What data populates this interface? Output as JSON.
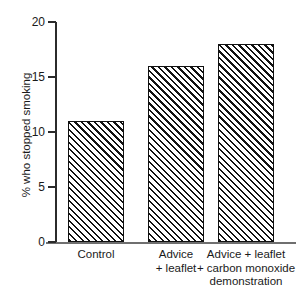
{
  "figure": {
    "top_clipped_text": "........ ..... .... ...... ... ......",
    "background_color": "#ffffff",
    "bar_outline_color": "#111111",
    "axis_color": "#2b2b2b"
  },
  "chart_data": {
    "type": "bar",
    "title": "",
    "xlabel": "",
    "ylabel": "% who stopped smoking",
    "categories": [
      "Control",
      "Advice\n+ leaflet",
      "Advice + leaflet\n+ carbon monoxide\ndemonstration"
    ],
    "category_lines": [
      [
        "Control"
      ],
      [
        "Advice",
        "+ leaflet"
      ],
      [
        "Advice + leaflet",
        "+ carbon monoxide",
        "demonstration"
      ]
    ],
    "values": [
      11,
      16,
      18
    ],
    "ylim": [
      0,
      20
    ],
    "yticks": [
      0,
      5,
      10,
      15,
      20
    ],
    "ytick_labels": [
      "0",
      "5",
      "10",
      "15",
      "20"
    ],
    "grid": false,
    "legend": null,
    "bar_fill": "diagonal-hatch"
  }
}
